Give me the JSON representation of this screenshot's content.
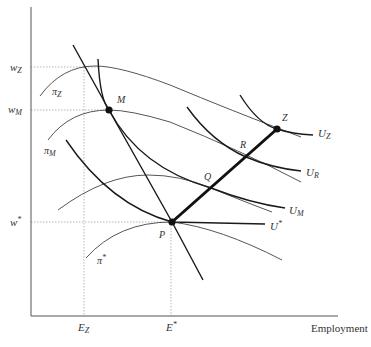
{
  "diagram": {
    "title": "",
    "x_axis_label": "Employment",
    "y_axis_label": "",
    "wage_levels": [
      {
        "id": "wZ",
        "base": "w",
        "sub": "Z",
        "y": 67
      },
      {
        "id": "wM",
        "base": "w",
        "sub": "M",
        "y": 110
      },
      {
        "id": "wstar",
        "base": "w",
        "sub": "*",
        "y": 222
      }
    ],
    "employment_levels": [
      {
        "id": "EZ",
        "base": "E",
        "sub": "Z",
        "x": 84
      },
      {
        "id": "Estar",
        "base": "E",
        "sub": "*",
        "x": 171
      }
    ],
    "points": [
      {
        "id": "M",
        "label": "M",
        "x": 109,
        "y": 110,
        "dot": true
      },
      {
        "id": "P",
        "label": "P",
        "x": 172,
        "y": 222,
        "dot": true
      },
      {
        "id": "Q",
        "label": "Q",
        "x": 211,
        "y": 188,
        "dot": false
      },
      {
        "id": "R",
        "label": "R",
        "x": 246,
        "y": 157,
        "dot": false
      },
      {
        "id": "Z",
        "label": "Z",
        "x": 277,
        "y": 129,
        "dot": true
      }
    ],
    "curves": {
      "isoprofit": [
        {
          "id": "pi_Z",
          "base": "π",
          "sub": "Z"
        },
        {
          "id": "pi_M",
          "base": "π",
          "sub": "M"
        },
        {
          "id": "pi_Q",
          "base": "",
          "sub": ""
        },
        {
          "id": "pi_star",
          "base": "π",
          "sub": "*"
        }
      ],
      "indifference": [
        {
          "id": "U_Z",
          "base": "U",
          "sub": "Z"
        },
        {
          "id": "U_R",
          "base": "U",
          "sub": "R"
        },
        {
          "id": "U_M",
          "base": "U",
          "sub": "M"
        },
        {
          "id": "U_star",
          "base": "U",
          "sub": "*"
        }
      ],
      "labor_demand": {
        "id": "labor-demand",
        "label": ""
      },
      "contract_curve": {
        "id": "contract-curve",
        "label": "",
        "from": "P",
        "to": "Z"
      }
    },
    "colors": {
      "axis": "#555555",
      "thick_curve": "#1a1a1a",
      "thin_curve": "#555555",
      "guide": "#999999",
      "text": "#333333"
    }
  }
}
